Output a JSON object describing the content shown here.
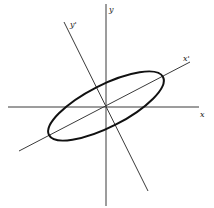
{
  "diagram": {
    "type": "rotated-ellipse-axes",
    "labels": {
      "x": "x",
      "y": "y",
      "x_prime": "x'",
      "y_prime": "y'"
    },
    "colors": {
      "line": "#3a3a3a",
      "ellipse": "#111111",
      "background": "#ffffff"
    },
    "origin": [
      106,
      107
    ],
    "ellipse": {
      "rotation_deg": -27,
      "semi_major_px": 68,
      "semi_minor_px": 25
    }
  }
}
